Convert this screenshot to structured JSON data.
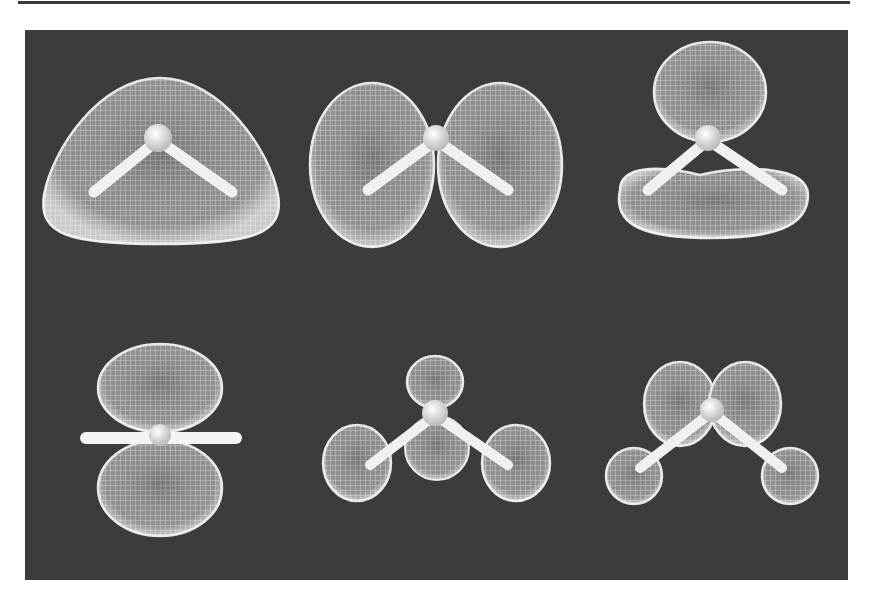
{
  "figure": {
    "background_color": "#3c3c3c",
    "surface_color": "#d8d8d8",
    "bond_color": "#f2f2f2",
    "panels": [
      {
        "id": "orbital-1",
        "shape": "single rounded triangular lobe enclosing molecule",
        "row": 1,
        "col": 1
      },
      {
        "id": "orbital-2",
        "shape": "two side-by-side lobes",
        "row": 1,
        "col": 2
      },
      {
        "id": "orbital-3",
        "shape": "top lobe above, wide lobe below",
        "row": 1,
        "col": 3
      },
      {
        "id": "orbital-4",
        "shape": "two lobes above and below, edge-on view",
        "row": 2,
        "col": 1
      },
      {
        "id": "orbital-5",
        "shape": "three small lobes on atoms plus central lobe",
        "row": 2,
        "col": 2
      },
      {
        "id": "orbital-6",
        "shape": "two upper lobes plus two hydrogen lobes",
        "row": 2,
        "col": 3
      }
    ]
  }
}
